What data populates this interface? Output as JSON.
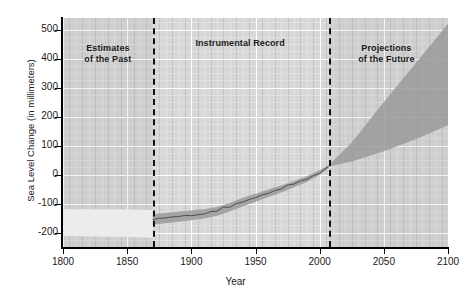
{
  "chart_data": {
    "type": "area",
    "title": "",
    "xlabel": "Year",
    "ylabel": "Sea Level Change (in millimeters)",
    "xlim": [
      1800,
      2100
    ],
    "ylim": [
      -250,
      540
    ],
    "xticks": [
      1800,
      1850,
      1900,
      1950,
      2000,
      2050,
      2100
    ],
    "yticks": [
      500,
      400,
      300,
      200,
      100,
      0,
      -100,
      -200
    ],
    "grid": true,
    "legend": "none",
    "annotations": [
      {
        "name": "estimates-of-the-past",
        "text": "Estimates\nof the Past",
        "x": 1835,
        "y": 455
      },
      {
        "name": "instrumental-record",
        "text": "Instrumental Record",
        "x": 1938,
        "y": 470
      },
      {
        "name": "projections-of-the-future",
        "text": "Projections\nof the Future",
        "x": 2052,
        "y": 455
      }
    ],
    "dividers": [
      {
        "name": "past-instrumental-divider",
        "x": 1870
      },
      {
        "name": "instrumental-projection-divider",
        "x": 2007
      }
    ],
    "series": [
      {
        "name": "Estimates of the Past (uncertainty band)",
        "kind": "band",
        "x": [
          1800,
          1825,
          1850,
          1870
        ],
        "upper": [
          -120,
          -120,
          -121,
          -122
        ],
        "lower": [
          -212,
          -214,
          -216,
          -218
        ]
      },
      {
        "name": "Instrumental Record (uncertainty band)",
        "kind": "band",
        "x": [
          1870,
          1880,
          1890,
          1900,
          1910,
          1920,
          1930,
          1940,
          1950,
          1960,
          1970,
          1980,
          1990,
          2000,
          2007
        ],
        "upper": [
          -137,
          -133,
          -128,
          -124,
          -120,
          -112,
          -98,
          -80,
          -66,
          -52,
          -38,
          -22,
          -6,
          16,
          32
        ],
        "lower": [
          -172,
          -168,
          -163,
          -158,
          -152,
          -142,
          -128,
          -110,
          -94,
          -78,
          -62,
          -44,
          -26,
          -2,
          22
        ]
      },
      {
        "name": "Instrumental Record (mean sea level)",
        "kind": "line",
        "x": [
          1870,
          1875,
          1880,
          1885,
          1890,
          1895,
          1900,
          1905,
          1910,
          1915,
          1920,
          1925,
          1930,
          1935,
          1940,
          1945,
          1950,
          1955,
          1960,
          1965,
          1970,
          1975,
          1980,
          1985,
          1990,
          1995,
          2000,
          2005,
          2007
        ],
        "y": [
          -155,
          -151,
          -150,
          -146,
          -145,
          -141,
          -142,
          -139,
          -136,
          -128,
          -126,
          -112,
          -113,
          -100,
          -95,
          -86,
          -80,
          -70,
          -65,
          -55,
          -50,
          -36,
          -33,
          -22,
          -16,
          -4,
          4,
          22,
          27
        ]
      },
      {
        "name": "Projections of the Future (range)",
        "kind": "band",
        "x": [
          2007,
          2025,
          2050,
          2075,
          2100
        ],
        "upper": [
          32,
          110,
          250,
          385,
          520
        ],
        "lower": [
          28,
          45,
          80,
          122,
          170
        ]
      }
    ]
  },
  "ticks": {
    "y": [
      "500",
      "400",
      "300",
      "200",
      "100",
      "0",
      "-100",
      "-200"
    ],
    "x": [
      "1800",
      "1850",
      "1900",
      "1950",
      "2000",
      "2050",
      "2100"
    ]
  },
  "labels": {
    "y_axis_title": "Sea Level Change (in millimeters)",
    "x_axis_title": "Year",
    "era_past_line1": "Estimates",
    "era_past_line2": "of the Past",
    "era_instrumental": "Instrumental Record",
    "era_future_line1": "Projections",
    "era_future_line2": "of the Future"
  },
  "colors": {
    "plot_background": "#d7d7d7",
    "gridline_major": "#ffffff",
    "band_fill": "#9a9a9a",
    "line": "#4d4d4d",
    "light_band": "#ececec",
    "axis": "#000000",
    "text": "#1a1a1a"
  }
}
